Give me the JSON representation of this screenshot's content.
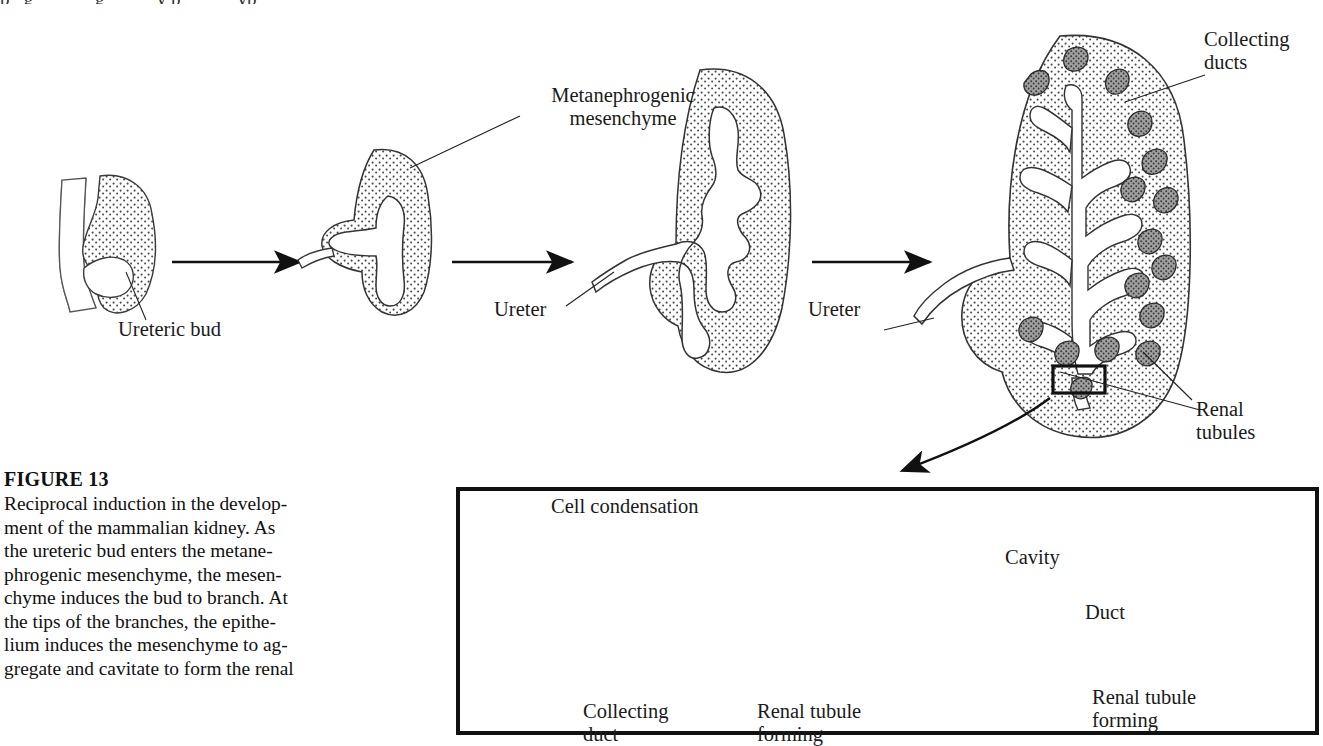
{
  "figure": {
    "number_label": "FIGURE 13",
    "caption_lines": [
      "Reciprocal induction in the develop-",
      "ment of the mammalian kidney. As",
      "the ureteric bud enters the metane-",
      "phrogenic mesenchyme, the mesen-",
      "chyme induces the bud to branch. At",
      "the tips of the branches, the epithe-",
      "lium induces the mesenchyme to ag-",
      "gregate and cavitate to form the renal"
    ],
    "cut_off_top_line": "p   g             g           y p            yp"
  },
  "main_diagram": {
    "labels": {
      "ureteric_bud": "Ureteric bud",
      "metanephrogenic_mesenchyme_line1": "Metanephrogenic",
      "metanephrogenic_mesenchyme_line2": "mesenchyme",
      "ureter_stage3": "Ureter",
      "ureter_stage4": "Ureter",
      "collecting_ducts_line1": "Collecting",
      "collecting_ducts_line2": "ducts",
      "renal_tubules_line1": "Renal",
      "renal_tubules_line2": "tubules"
    },
    "stages": [
      {
        "name": "ureteric-bud-stage",
        "description": "Ureteric bud sprouting from nephric duct"
      },
      {
        "name": "t-bud-stage",
        "description": "T-shaped bud inside metanephrogenic mesenchyme"
      },
      {
        "name": "branching-stage",
        "description": "Lobed branching ureteric bud"
      },
      {
        "name": "mature-kidney-stage",
        "description": "Branched collecting duct tree with renal tubules"
      }
    ],
    "arrow_count": 3
  },
  "inset": {
    "labels": {
      "cell_condensation": "Cell condensation",
      "collecting_duct_line1": "Collecting",
      "collecting_duct_line2": "duct",
      "renal_tubule_forming_line1": "Renal tubule",
      "renal_tubule_forming_line2": "forming",
      "cavity": "Cavity",
      "duct": "Duct",
      "renal_tubule_line1": "Renal tubule",
      "renal_tubule_line2": "forming"
    },
    "stages": [
      {
        "name": "condensation",
        "description": "Mesenchyme condenses on duct tip"
      },
      {
        "name": "aggregate",
        "description": "Condensed aggregate elongates alongside duct"
      },
      {
        "name": "cavitation",
        "description": "Aggregate cavitates into a lumen"
      },
      {
        "name": "tubule",
        "description": "Renal tubule joins the duct"
      }
    ],
    "arrow_count": 3
  },
  "colors": {
    "ink": "#111111",
    "mesenchyme_stipple": "#c9c9c9",
    "condensation_fill": "#9a9a9a",
    "epithelium_fill": "#ffffff",
    "tubule_dark": "#7a7a7a",
    "background": "#ffffff"
  }
}
